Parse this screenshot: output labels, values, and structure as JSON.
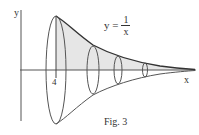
{
  "figure": {
    "caption": "Fig. 3",
    "axes": {
      "x_label": "x",
      "y_label": "y"
    },
    "tick": {
      "label": "4"
    },
    "function_label": {
      "lhs": "y =",
      "numerator": "1",
      "denominator": "x"
    },
    "colors": {
      "line": "#333333",
      "shade": "#e6e6e6",
      "background": "#ffffff"
    }
  }
}
